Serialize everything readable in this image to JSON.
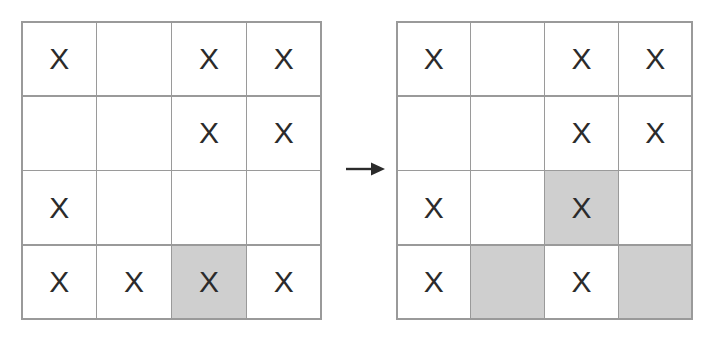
{
  "figure": {
    "title": "",
    "arrow_icon": "arrow-right-icon",
    "shaded_color": "#cfcfcf",
    "grid_line_color": "#9a9a9a",
    "mark_color": "#2b2b2b",
    "cell_background": "#ffffff"
  },
  "grids": [
    {
      "id": "before-grid",
      "label": "",
      "rows": 4,
      "cols": 4,
      "cells": [
        {
          "mark": "X",
          "shaded": false
        },
        {
          "mark": "",
          "shaded": false
        },
        {
          "mark": "X",
          "shaded": false
        },
        {
          "mark": "X",
          "shaded": false
        },
        {
          "mark": "",
          "shaded": false
        },
        {
          "mark": "",
          "shaded": false
        },
        {
          "mark": "X",
          "shaded": false
        },
        {
          "mark": "X",
          "shaded": false
        },
        {
          "mark": "X",
          "shaded": false
        },
        {
          "mark": "",
          "shaded": false
        },
        {
          "mark": "",
          "shaded": false
        },
        {
          "mark": "",
          "shaded": false
        },
        {
          "mark": "X",
          "shaded": false
        },
        {
          "mark": "X",
          "shaded": false
        },
        {
          "mark": "X",
          "shaded": true
        },
        {
          "mark": "X",
          "shaded": false
        }
      ]
    },
    {
      "id": "after-grid",
      "label": "",
      "rows": 4,
      "cols": 4,
      "cells": [
        {
          "mark": "X",
          "shaded": false
        },
        {
          "mark": "",
          "shaded": false
        },
        {
          "mark": "X",
          "shaded": false
        },
        {
          "mark": "X",
          "shaded": false
        },
        {
          "mark": "",
          "shaded": false
        },
        {
          "mark": "",
          "shaded": false
        },
        {
          "mark": "X",
          "shaded": false
        },
        {
          "mark": "X",
          "shaded": false
        },
        {
          "mark": "X",
          "shaded": false
        },
        {
          "mark": "",
          "shaded": false
        },
        {
          "mark": "X",
          "shaded": true
        },
        {
          "mark": "",
          "shaded": false
        },
        {
          "mark": "X",
          "shaded": false
        },
        {
          "mark": "",
          "shaded": true
        },
        {
          "mark": "X",
          "shaded": false
        },
        {
          "mark": "",
          "shaded": true
        }
      ]
    }
  ]
}
